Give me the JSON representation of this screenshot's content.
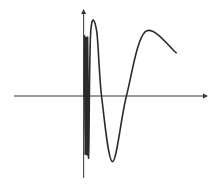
{
  "chart_data": {
    "type": "line",
    "title": "",
    "xlabel": "",
    "ylabel": "",
    "function": "y = sin(1/x)",
    "xlim": [
      -0.7,
      1.25
    ],
    "ylim": [
      -1.25,
      1.25
    ],
    "grid": false,
    "legend": "none",
    "axes": {
      "x_arrow": true,
      "y_arrow": true,
      "ticks": false
    },
    "series": [
      {
        "name": "curve",
        "color": "#2b2b2b",
        "points": [
          [
            0.005,
            0.0
          ],
          [
            0.01,
            0.9
          ],
          [
            0.015,
            -0.9
          ],
          [
            0.02,
            0.9
          ],
          [
            0.025,
            -0.9
          ],
          [
            0.03,
            0.9
          ],
          [
            0.035,
            -0.9
          ],
          [
            0.04,
            0.9
          ],
          [
            0.05,
            -0.95
          ],
          [
            0.07,
            0.95
          ],
          [
            0.13,
            1.0
          ],
          [
            0.18,
            0.0
          ],
          [
            0.29,
            -1.0
          ],
          [
            0.43,
            0.0
          ],
          [
            0.62,
            0.98
          ],
          [
            0.93,
            0.66
          ]
        ]
      }
    ],
    "colors": {
      "axis": "#333333",
      "curve": "#2b2b2b",
      "background": "#ffffff"
    }
  }
}
